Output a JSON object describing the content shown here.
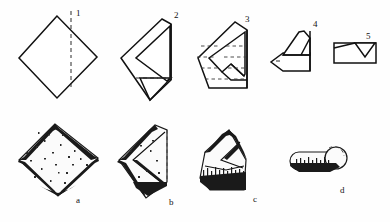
{
  "plate": {
    "title": "Folding diagram plate",
    "background_color": "#fefefe",
    "ink_color": "#111111",
    "fold_line_color": "#2a2a2a",
    "width": 390,
    "height": 222
  },
  "diagram_row": {
    "row_label": "Step diagrams",
    "steps": [
      {
        "number": "1",
        "name": "square-diamond",
        "description": "Square napkin set on point with a vertical dashed centre fold line",
        "label_x": 76,
        "label_y": 16
      },
      {
        "number": "2",
        "name": "folded-chevron",
        "description": "Napkin folded to a chevron with a horizontal dashed fold line near the base",
        "label_x": 174,
        "label_y": 18
      },
      {
        "number": "3",
        "name": "pleated-wedge",
        "description": "Wedge shape with four horizontal dashed pleat lines",
        "label_x": 245,
        "label_y": 22
      },
      {
        "number": "4",
        "name": "rolled-point",
        "description": "Flat band with a raised triangular flap and an arrow point at the left end",
        "label_x": 313,
        "label_y": 27
      },
      {
        "number": "5",
        "name": "finished-bar",
        "description": "Horizontal rectangle bar with a small inverted triangular tuck",
        "label_x": 366,
        "label_y": 30
      }
    ]
  },
  "photo_row": {
    "row_label": "Photographic results",
    "items": [
      {
        "letter": "a",
        "name": "photo-square",
        "description": "Textured cloth square laid on point",
        "label_x": 76,
        "label_y": 203
      },
      {
        "letter": "b",
        "name": "photo-chevron",
        "description": "Cloth folded into a chevron form",
        "label_x": 169,
        "label_y": 205
      },
      {
        "letter": "c",
        "name": "photo-wedge",
        "description": "Cloth pleated into a fringed wedge",
        "label_x": 253,
        "label_y": 202
      },
      {
        "letter": "d",
        "name": "photo-roll",
        "description": "Cloth rolled into a short bar with rounded end",
        "label_x": 340,
        "label_y": 193
      }
    ]
  }
}
